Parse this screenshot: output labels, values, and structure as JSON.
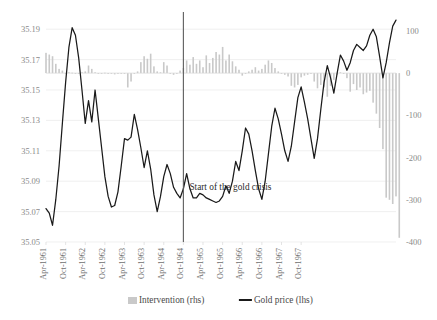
{
  "chart_data": {
    "type": "bar",
    "title": "",
    "subtitle": "",
    "xlabel": "",
    "ylabel_left": "",
    "ylabel_right": "",
    "grid": true,
    "legend_position": "bottom",
    "left_axis": {
      "name": "Gold price (lhs)",
      "ticks": [
        "35.19",
        "35.17",
        "35.15",
        "35.13",
        "35.11",
        "35.09",
        "35.07",
        "35.05"
      ],
      "tick_values": [
        35.19,
        35.17,
        35.15,
        35.13,
        35.11,
        35.09,
        35.07,
        35.05
      ],
      "ylim": [
        35.05,
        35.2
      ]
    },
    "right_axis": {
      "name": "Intervention (rhs)",
      "ticks": [
        "100",
        "0",
        "-100",
        "-200",
        "-300",
        "-400"
      ],
      "tick_values": [
        100,
        0,
        -100,
        -200,
        -300,
        -400
      ],
      "ylim": [
        -400,
        140
      ]
    },
    "x_tick_labels": [
      "Apr-1961",
      "Oct-1961",
      "Apr-1962",
      "Oct-1962",
      "Apr-1963",
      "Oct-1963",
      "Apr-1964",
      "Oct-1964",
      "Apr-1965",
      "Oct-1965",
      "Apr-1966",
      "Oct-1966",
      "Apr-1967",
      "Oct-1967"
    ],
    "x_tick_indices": [
      0,
      6,
      12,
      18,
      24,
      30,
      36,
      42,
      48,
      54,
      60,
      66,
      72,
      78
    ],
    "annotations": [
      {
        "text": "Start of the gold crisis",
        "x_index": 42,
        "type": "vertical-line-with-label"
      }
    ],
    "legend": [
      {
        "label": "Intervention (rhs)",
        "marker": "bar",
        "color": "#c9c9c9"
      },
      {
        "label": "Gold price (lhs)",
        "marker": "line",
        "color": "#1a1a1a"
      }
    ],
    "series": [
      {
        "name": "Gold price (lhs)",
        "axis": "left",
        "type": "line",
        "color": "#1a1a1a",
        "values": [
          35.072,
          35.069,
          35.061,
          35.078,
          35.1,
          35.128,
          35.155,
          35.178,
          35.191,
          35.186,
          35.171,
          35.15,
          35.128,
          35.143,
          35.129,
          35.15,
          35.131,
          35.112,
          35.093,
          35.08,
          35.073,
          35.074,
          35.083,
          35.1,
          35.118,
          35.117,
          35.119,
          35.134,
          35.124,
          35.112,
          35.099,
          35.11,
          35.098,
          35.081,
          35.07,
          35.08,
          35.093,
          35.101,
          35.095,
          35.086,
          35.082,
          35.079,
          35.085,
          35.095,
          35.085,
          35.079,
          35.079,
          35.082,
          35.081,
          35.079,
          35.078,
          35.077,
          35.076,
          35.077,
          35.08,
          35.087,
          35.082,
          35.09,
          35.103,
          35.097,
          35.11,
          35.125,
          35.121,
          35.11,
          35.097,
          35.085,
          35.078,
          35.09,
          35.108,
          35.126,
          35.138,
          35.131,
          35.121,
          35.11,
          35.103,
          35.113,
          35.129,
          35.145,
          35.152,
          35.142,
          35.131,
          35.118,
          35.105,
          35.118,
          35.137,
          35.155,
          35.166,
          35.158,
          35.148,
          35.161,
          35.173,
          35.169,
          35.163,
          35.168,
          35.176,
          35.18,
          35.178,
          35.176,
          35.179,
          35.186,
          35.19,
          35.185,
          35.172,
          35.158,
          35.168,
          35.181,
          35.192,
          35.196
        ]
      },
      {
        "name": "Intervention (rhs)",
        "axis": "right",
        "type": "bar",
        "color": "#c9c9c9",
        "values": [
          48,
          44,
          40,
          22,
          10,
          6,
          -2,
          2,
          1,
          0,
          -1,
          2,
          4,
          18,
          10,
          2,
          -1,
          0,
          1,
          -2,
          -1,
          -3,
          -2,
          -1,
          -1,
          -34,
          -20,
          -2,
          4,
          26,
          40,
          34,
          46,
          16,
          4,
          2,
          26,
          18,
          -2,
          -4,
          -2,
          6,
          12,
          30,
          20,
          38,
          22,
          30,
          14,
          42,
          24,
          36,
          50,
          44,
          62,
          30,
          44,
          28,
          16,
          8,
          -6,
          -2,
          4,
          8,
          14,
          6,
          10,
          20,
          30,
          24,
          12,
          4,
          -2,
          -4,
          -8,
          -30,
          -34,
          -28,
          -10,
          -6,
          -4,
          -2,
          -20,
          -36,
          -28,
          -34,
          -56,
          -30,
          -16,
          -4,
          2,
          -2,
          -12,
          -44,
          -26,
          -40,
          -34,
          -50,
          -46,
          -42,
          -70,
          -96,
          -130,
          -180,
          -295,
          -300,
          -310,
          -292,
          -390
        ]
      }
    ],
    "n_points": 108
  }
}
